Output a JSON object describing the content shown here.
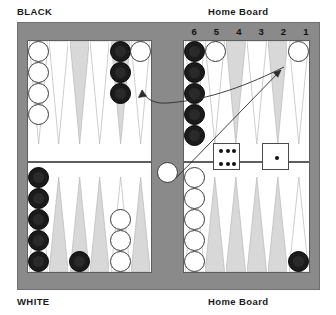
{
  "labels": {
    "black": "BLACK",
    "white": "WHITE",
    "home_board_top": "Home Board",
    "home_board_bottom": "Home Board"
  },
  "colors": {
    "frame": "#8a8a8a",
    "field": "#ffffff",
    "point_light": "#ffffff",
    "point_dark": "#d8d8d8",
    "checker_white": "#ffffff",
    "checker_black": "#1b1b1b",
    "bar": "#8a8a8a",
    "text": "#1a1a1a"
  },
  "point_numbers": [
    "6",
    "5",
    "4",
    "3",
    "2",
    "1"
  ],
  "board": {
    "quadrants": {
      "top_left": {
        "points": [
          {
            "index": 1,
            "shade": "light",
            "checkers": 4,
            "color": "white"
          },
          {
            "index": 2,
            "shade": "light",
            "checkers": 0,
            "color": ""
          },
          {
            "index": 3,
            "shade": "dark",
            "checkers": 0,
            "color": ""
          },
          {
            "index": 4,
            "shade": "light",
            "checkers": 0,
            "color": ""
          },
          {
            "index": 5,
            "shade": "dark",
            "checkers": 3,
            "color": "black"
          },
          {
            "index": 6,
            "shade": "light",
            "checkers": 1,
            "color": "white"
          }
        ]
      },
      "top_right": {
        "points": [
          {
            "index": 6,
            "shade": "light",
            "checkers": 5,
            "color": "black"
          },
          {
            "index": 5,
            "shade": "light",
            "checkers": 1,
            "color": "white"
          },
          {
            "index": 4,
            "shade": "dark",
            "checkers": 0,
            "color": ""
          },
          {
            "index": 3,
            "shade": "light",
            "checkers": 0,
            "color": ""
          },
          {
            "index": 2,
            "shade": "dark",
            "checkers": 0,
            "color": ""
          },
          {
            "index": 1,
            "shade": "light",
            "checkers": 1,
            "color": "white"
          }
        ]
      },
      "bottom_left": {
        "points": [
          {
            "index": 1,
            "shade": "light",
            "checkers": 5,
            "color": "black"
          },
          {
            "index": 2,
            "shade": "dark",
            "checkers": 0,
            "color": ""
          },
          {
            "index": 3,
            "shade": "dark",
            "checkers": 1,
            "color": "black"
          },
          {
            "index": 4,
            "shade": "dark",
            "checkers": 0,
            "color": ""
          },
          {
            "index": 5,
            "shade": "light",
            "checkers": 3,
            "color": "white"
          },
          {
            "index": 6,
            "shade": "dark",
            "checkers": 0,
            "color": ""
          }
        ]
      },
      "bottom_right": {
        "points": [
          {
            "index": 6,
            "shade": "light",
            "checkers": 5,
            "color": "white"
          },
          {
            "index": 5,
            "shade": "dark",
            "checkers": 0,
            "color": ""
          },
          {
            "index": 4,
            "shade": "dark",
            "checkers": 0,
            "color": ""
          },
          {
            "index": 3,
            "shade": "dark",
            "checkers": 0,
            "color": ""
          },
          {
            "index": 2,
            "shade": "dark",
            "checkers": 0,
            "color": ""
          },
          {
            "index": 1,
            "shade": "light",
            "checkers": 1,
            "color": "black"
          }
        ]
      }
    },
    "bar_checkers": [
      {
        "color": "white",
        "count": 1
      }
    ]
  },
  "dice": [
    {
      "value": 6,
      "position": "left"
    },
    {
      "value": 1,
      "position": "right"
    }
  ],
  "move_arrows": [
    {
      "id": "arrow-six",
      "from": "home-point-1-area",
      "to": "top-left-outer-point",
      "die": 6
    },
    {
      "id": "arrow-one",
      "from": "bar",
      "to": "home-point-1",
      "die": 1
    }
  ]
}
